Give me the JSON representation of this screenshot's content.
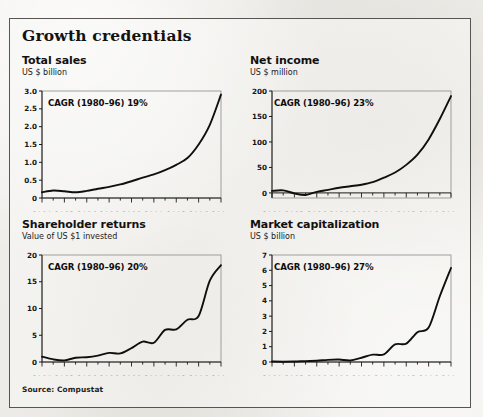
{
  "figure": {
    "title": "Growth credentials",
    "source": "Source: Compustat",
    "years": [
      1980,
      1981,
      1982,
      1983,
      1984,
      1985,
      1986,
      1987,
      1988,
      1989,
      1990,
      1991,
      1992,
      1993,
      1994,
      1995,
      1996
    ],
    "xticklabels": [
      "1980",
      "1982",
      "1984",
      "1986",
      "1988",
      "1990",
      "1992",
      "1994",
      "1996"
    ]
  },
  "chart_data": [
    {
      "type": "line",
      "title": "Total sales",
      "subtitle": "US $ billion",
      "annotation": "CAGR (1980–96) 19%",
      "xlabel": "",
      "ylabel": "US $ billion",
      "x": [
        1980,
        1981,
        1982,
        1983,
        1984,
        1985,
        1986,
        1987,
        1988,
        1989,
        1990,
        1991,
        1992,
        1993,
        1994,
        1995,
        1996
      ],
      "values": [
        0.16,
        0.21,
        0.19,
        0.16,
        0.2,
        0.26,
        0.31,
        0.38,
        0.47,
        0.57,
        0.66,
        0.78,
        0.93,
        1.12,
        1.5,
        2.05,
        2.9
      ],
      "ylim": [
        0,
        3.0
      ],
      "yticks": [
        0,
        0.5,
        1.0,
        1.5,
        2.0,
        2.5,
        3.0
      ],
      "yticklabels": [
        "0",
        "0.5",
        "1.0",
        "1.5",
        "2.0",
        "2.5",
        "3.0"
      ],
      "xlim": [
        1980,
        1996
      ],
      "grid": false,
      "legend": "none"
    },
    {
      "type": "line",
      "title": "Net income",
      "subtitle": "US $ million",
      "annotation": "CAGR (1980–96) 23%",
      "xlabel": "",
      "ylabel": "US $ million",
      "x": [
        1980,
        1981,
        1982,
        1983,
        1984,
        1985,
        1986,
        1987,
        1988,
        1989,
        1990,
        1991,
        1992,
        1993,
        1994,
        1995,
        1996
      ],
      "values": [
        4,
        5,
        -1,
        -4,
        2,
        6,
        10,
        13,
        16,
        21,
        30,
        40,
        55,
        75,
        105,
        145,
        190
      ],
      "ylim": [
        -10,
        200
      ],
      "yticks": [
        0,
        50,
        100,
        150,
        200
      ],
      "yticklabels": [
        "0",
        "50",
        "100",
        "150",
        "200"
      ],
      "xlim": [
        1980,
        1996
      ],
      "grid": false,
      "legend": "none"
    },
    {
      "type": "line",
      "title": "Shareholder returns",
      "subtitle": "Value of US $1 invested",
      "annotation": "CAGR (1980–96) 20%",
      "xlabel": "",
      "ylabel": "Value of US $1 invested",
      "x": [
        1980,
        1981,
        1982,
        1983,
        1984,
        1985,
        1986,
        1987,
        1988,
        1989,
        1990,
        1991,
        1992,
        1993,
        1994,
        1995,
        1996
      ],
      "values": [
        1.0,
        0.5,
        0.3,
        0.8,
        0.9,
        1.2,
        1.7,
        1.6,
        2.6,
        3.8,
        3.6,
        6.0,
        6.1,
        7.9,
        8.6,
        15.2,
        18.1
      ],
      "ylim": [
        0,
        20
      ],
      "yticks": [
        0,
        5,
        10,
        15,
        20
      ],
      "yticklabels": [
        "0",
        "5",
        "10",
        "15",
        "20"
      ],
      "xlim": [
        1980,
        1996
      ],
      "grid": false,
      "legend": "none"
    },
    {
      "type": "line",
      "title": "Market capitalization",
      "subtitle": "US $ billion",
      "annotation": "CAGR (1980–96) 27%",
      "xlabel": "",
      "ylabel": "US $ billion",
      "x": [
        1980,
        1981,
        1982,
        1983,
        1984,
        1985,
        1986,
        1987,
        1988,
        1989,
        1990,
        1991,
        1992,
        1993,
        1994,
        1995,
        1996
      ],
      "values": [
        0.03,
        0.02,
        0.03,
        0.06,
        0.08,
        0.14,
        0.16,
        0.1,
        0.28,
        0.48,
        0.5,
        1.15,
        1.2,
        1.95,
        2.25,
        4.3,
        6.15
      ],
      "ylim": [
        0,
        7
      ],
      "yticks": [
        0,
        1,
        2,
        3,
        4,
        5,
        6,
        7
      ],
      "yticklabels": [
        "0",
        "1",
        "2",
        "3",
        "4",
        "5",
        "6",
        "7"
      ],
      "xlim": [
        1980,
        1996
      ],
      "grid": false,
      "legend": "none"
    }
  ]
}
